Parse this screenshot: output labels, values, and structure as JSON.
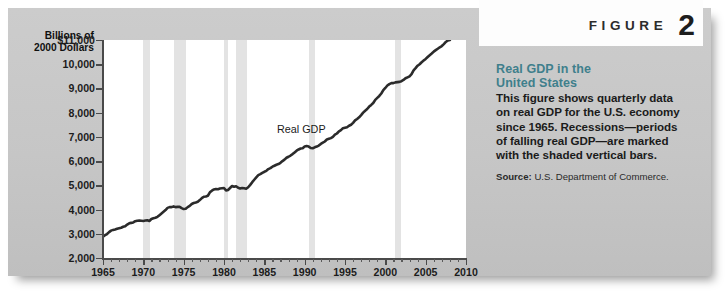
{
  "figure": {
    "word": "FIGURE",
    "number": "2"
  },
  "caption": {
    "title_line1": "Real GDP in the",
    "title_line2": "United States",
    "body": "This figure shows quarterly data on real GDP for the U.S. economy since 1965. Recessions—periods of falling real GDP—are marked with the shaded vertical bars.",
    "source_label": "Source:",
    "source_text": "U.S. Department of Commerce."
  },
  "chart_data": {
    "type": "line",
    "title": "Real GDP in the United States",
    "xlabel": "",
    "ylabel": "Billions of 2000 Dollars",
    "ylabel_line1": "Billions of",
    "ylabel_line2": "2000 Dollars",
    "xlim": [
      1965,
      2010
    ],
    "ylim": [
      2000,
      11000
    ],
    "grid": false,
    "legend": "none",
    "series_annotation": "Real GDP",
    "y_ticks": [
      11000,
      10000,
      9000,
      8000,
      7000,
      6000,
      5000,
      4000,
      3000,
      2000
    ],
    "y_tick_labels": [
      "$11,000",
      "10,000",
      "9,000",
      "8,000",
      "7,000",
      "6,000",
      "5,000",
      "4,000",
      "3,000",
      "2,000"
    ],
    "x_ticks": [
      1965,
      1970,
      1975,
      1980,
      1985,
      1990,
      1995,
      2000,
      2005,
      2010
    ],
    "x_tick_labels": [
      "1965",
      "1970",
      "1975",
      "1980",
      "1985",
      "1990",
      "1995",
      "2000",
      "2005",
      "2010"
    ],
    "x_minor_tick_interval": 1,
    "line_color": "#2b2b2b",
    "recession_bar_color": "#e3e3e3",
    "plot_background": "#ffffff",
    "panel_background": "#c9c9c9",
    "accent_color": "#3f7f8c",
    "recessions": [
      {
        "start": 1969.92,
        "end": 1970.83
      },
      {
        "start": 1973.83,
        "end": 1975.25
      },
      {
        "start": 1980.0,
        "end": 1980.5
      },
      {
        "start": 1981.5,
        "end": 1982.83
      },
      {
        "start": 1990.5,
        "end": 1991.25
      },
      {
        "start": 2001.17,
        "end": 2001.92
      }
    ],
    "series": [
      {
        "name": "Real GDP",
        "x": [
          1965.0,
          1965.25,
          1965.5,
          1965.75,
          1966.0,
          1966.25,
          1966.5,
          1966.75,
          1967.0,
          1967.25,
          1967.5,
          1967.75,
          1968.0,
          1968.25,
          1968.5,
          1968.75,
          1969.0,
          1969.25,
          1969.5,
          1969.75,
          1970.0,
          1970.25,
          1970.5,
          1970.75,
          1971.0,
          1971.25,
          1971.5,
          1971.75,
          1972.0,
          1972.25,
          1972.5,
          1972.75,
          1973.0,
          1973.25,
          1973.5,
          1973.75,
          1974.0,
          1974.25,
          1974.5,
          1974.75,
          1975.0,
          1975.25,
          1975.5,
          1975.75,
          1976.0,
          1976.25,
          1976.5,
          1976.75,
          1977.0,
          1977.25,
          1977.5,
          1977.75,
          1978.0,
          1978.25,
          1978.5,
          1978.75,
          1979.0,
          1979.25,
          1979.5,
          1979.75,
          1980.0,
          1980.25,
          1980.5,
          1980.75,
          1981.0,
          1981.25,
          1981.5,
          1981.75,
          1982.0,
          1982.25,
          1982.5,
          1982.75,
          1983.0,
          1983.25,
          1983.5,
          1983.75,
          1984.0,
          1984.25,
          1984.5,
          1984.75,
          1985.0,
          1985.25,
          1985.5,
          1985.75,
          1986.0,
          1986.25,
          1986.5,
          1986.75,
          1987.0,
          1987.25,
          1987.5,
          1987.75,
          1988.0,
          1988.25,
          1988.5,
          1988.75,
          1989.0,
          1989.25,
          1989.5,
          1989.75,
          1990.0,
          1990.25,
          1990.5,
          1990.75,
          1991.0,
          1991.25,
          1991.5,
          1991.75,
          1992.0,
          1992.25,
          1992.5,
          1992.75,
          1993.0,
          1993.25,
          1993.5,
          1993.75,
          1994.0,
          1994.25,
          1994.5,
          1994.75,
          1995.0,
          1995.25,
          1995.5,
          1995.75,
          1996.0,
          1996.25,
          1996.5,
          1996.75,
          1997.0,
          1997.25,
          1997.5,
          1997.75,
          1998.0,
          1998.25,
          1998.5,
          1998.75,
          1999.0,
          1999.25,
          1999.5,
          1999.75,
          2000.0,
          2000.25,
          2000.5,
          2000.75,
          2001.0,
          2001.25,
          2001.5,
          2001.75,
          2002.0,
          2002.25,
          2002.5,
          2002.75,
          2003.0,
          2003.25,
          2003.5,
          2003.75,
          2004.0,
          2004.25,
          2004.5,
          2004.75,
          2005.0,
          2005.25,
          2005.5,
          2005.75,
          2006.0,
          2006.25,
          2006.5,
          2006.75,
          2007.0,
          2007.25,
          2007.5,
          2007.75,
          2008.0
        ],
        "values": [
          2880,
          2940,
          2990,
          3070,
          3130,
          3160,
          3180,
          3210,
          3230,
          3250,
          3290,
          3310,
          3380,
          3430,
          3450,
          3470,
          3520,
          3540,
          3550,
          3540,
          3530,
          3550,
          3560,
          3530,
          3610,
          3640,
          3660,
          3700,
          3770,
          3840,
          3910,
          3980,
          4070,
          4100,
          4100,
          4130,
          4100,
          4110,
          4110,
          4060,
          4020,
          4030,
          4100,
          4150,
          4230,
          4270,
          4290,
          4320,
          4390,
          4470,
          4530,
          4540,
          4570,
          4710,
          4780,
          4830,
          4850,
          4840,
          4870,
          4880,
          4890,
          4790,
          4810,
          4890,
          4970,
          4940,
          4960,
          4900,
          4870,
          4890,
          4880,
          4860,
          4920,
          5020,
          5130,
          5230,
          5330,
          5420,
          5460,
          5510,
          5560,
          5600,
          5670,
          5710,
          5770,
          5810,
          5850,
          5880,
          5930,
          6000,
          6060,
          6140,
          6180,
          6230,
          6290,
          6360,
          6430,
          6480,
          6520,
          6530,
          6600,
          6620,
          6600,
          6540,
          6530,
          6570,
          6600,
          6640,
          6710,
          6760,
          6810,
          6890,
          6920,
          6950,
          7000,
          7090,
          7140,
          7230,
          7280,
          7360,
          7380,
          7400,
          7460,
          7500,
          7580,
          7680,
          7740,
          7810,
          7900,
          8000,
          8080,
          8150,
          8250,
          8320,
          8400,
          8530,
          8610,
          8690,
          8790,
          8930,
          9020,
          9120,
          9180,
          9220,
          9220,
          9250,
          9260,
          9270,
          9300,
          9350,
          9420,
          9460,
          9500,
          9590,
          9750,
          9840,
          9940,
          10000,
          10080,
          10150,
          10220,
          10300,
          10370,
          10440,
          10520,
          10580,
          10640,
          10700,
          10750,
          10830,
          10920,
          10980,
          11000
        ]
      }
    ]
  }
}
